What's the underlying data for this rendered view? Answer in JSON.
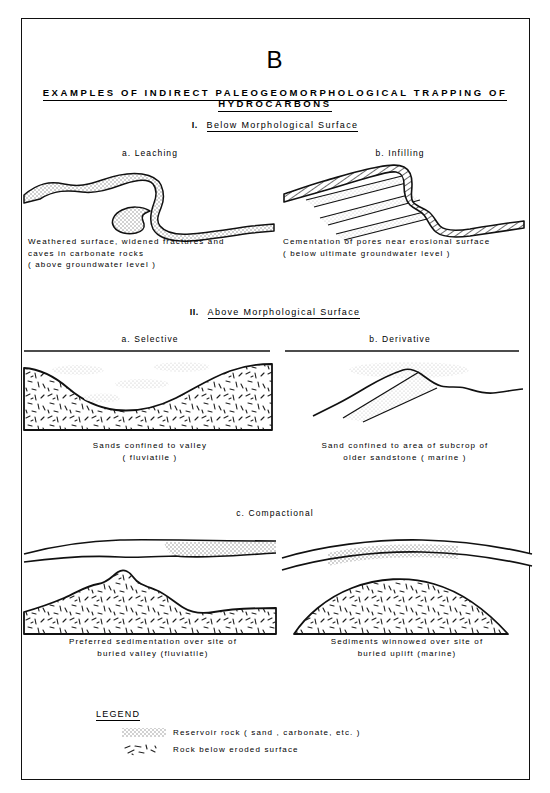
{
  "figure": {
    "panel_letter": "B",
    "title": "EXAMPLES  OF  INDIRECT  PALEOGEOMORPHOLOGICAL  TRAPPING  OF  HYDROCARBONS"
  },
  "sections": [
    {
      "numeral": "I.",
      "heading": "Below   Morphological   Surface",
      "panels": [
        {
          "label": "a. Leaching",
          "caption": "Weathered  surface,  widened  fractures  and\ncaves  in  carbonate  rocks\n( above  groundwater  level )"
        },
        {
          "label": "b. Infilling",
          "caption": "Cementation  of  pores  near  erosional  surface\n( below  ultimate  groundwater  level )"
        }
      ]
    },
    {
      "numeral": "II.",
      "heading": "Above   Morphological   Surface",
      "panels": [
        {
          "label": "a. Selective",
          "caption": "Sands  confined  to  valley\n( fluviatile )"
        },
        {
          "label": "b. Derivative",
          "caption": "Sand  confined  to  area  of  subcrop  of\nolder  sandstone  ( marine )"
        },
        {
          "label": "c. Compactional",
          "caption": "Preferred  sedimentation  over  site  of\nburied  valley  (fluviatile)"
        },
        {
          "label": "",
          "caption": "Sediments  winnowed  over  site  of\nburied  uplift  (marine)"
        }
      ]
    }
  ],
  "legend": {
    "title": "LEGEND",
    "entries": [
      {
        "swatch": "stipple",
        "label": "Reservoir  rock   ( sand ,  carbonate,  etc. )"
      },
      {
        "swatch": "dashes",
        "label": "Rock  below  eroded  surface"
      }
    ]
  },
  "colors": {
    "ink": "#111111",
    "stipple": "#9a9a9a",
    "paper": "#ffffff"
  }
}
